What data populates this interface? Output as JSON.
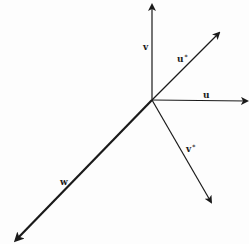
{
  "diagram": {
    "origin": [
      152,
      100
    ],
    "colors": {
      "stroke": "#1a1a1a",
      "background": "#fdfdfd"
    },
    "vectors": [
      {
        "id": "v",
        "label": "v",
        "sup": "",
        "end": [
          152,
          5
        ],
        "width": 1.2,
        "label_pos": [
          143,
          50
        ]
      },
      {
        "id": "u-star",
        "label": "u",
        "sup": "*",
        "end": [
          219,
          33
        ],
        "width": 1.2,
        "label_pos": [
          177,
          62
        ]
      },
      {
        "id": "u",
        "label": "u",
        "sup": "",
        "end": [
          247,
          101
        ],
        "width": 1.2,
        "label_pos": [
          203,
          98
        ]
      },
      {
        "id": "v-star",
        "label": "v",
        "sup": "*",
        "end": [
          211,
          202
        ],
        "width": 1.2,
        "label_pos": [
          186,
          152
        ]
      },
      {
        "id": "w",
        "label": "w",
        "sup": "",
        "end": [
          16,
          240
        ],
        "width": 2.2,
        "label_pos": [
          60,
          185
        ]
      }
    ]
  }
}
